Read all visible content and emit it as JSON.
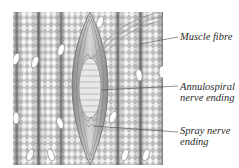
{
  "diagram": {
    "labels": [
      {
        "id": "muscle_fibre",
        "lines": [
          "Muscle fibre"
        ]
      },
      {
        "id": "annulospiral",
        "lines": [
          "Annulospiral",
          "nerve ending"
        ]
      },
      {
        "id": "spray",
        "lines": [
          "Spray nerve",
          "ending"
        ]
      }
    ]
  },
  "colors": {
    "background": "#ffffff",
    "fibre_dark": "#7a7a7a",
    "fibre_light": "#f2f2f2",
    "spindle": "#9a9a9a",
    "leader_line": "#444444",
    "text": "#2a2a2a"
  }
}
